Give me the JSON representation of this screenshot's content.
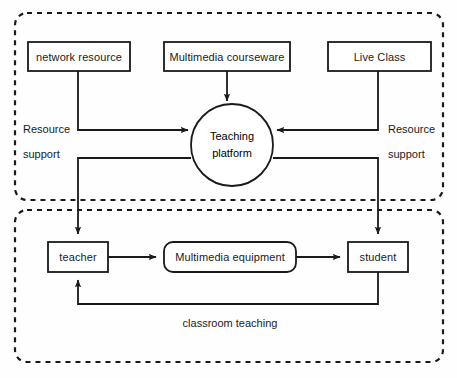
{
  "diagram": {
    "colors": {
      "stroke": "#1a1a1a",
      "background": "#fefefe",
      "text": "#1a1a1a"
    },
    "groups": [
      {
        "id": "resource-group",
        "label": ""
      },
      {
        "id": "classroom-group",
        "label": ""
      }
    ],
    "nodes": {
      "network_resource": "network resource",
      "multimedia_courseware": "Multimedia courseware",
      "live_class": "Live Class",
      "teaching_platform_line1": "Teaching",
      "teaching_platform_line2": "platform",
      "teacher": "teacher",
      "multimedia_equipment": "Multimedia equipment",
      "student": "student"
    },
    "edge_labels": {
      "resource_support_left_line1": "Resource",
      "resource_support_left_line2": "support",
      "resource_support_right_line1": "Resource",
      "resource_support_right_line2": "support",
      "classroom_teaching": "classroom teaching"
    }
  }
}
